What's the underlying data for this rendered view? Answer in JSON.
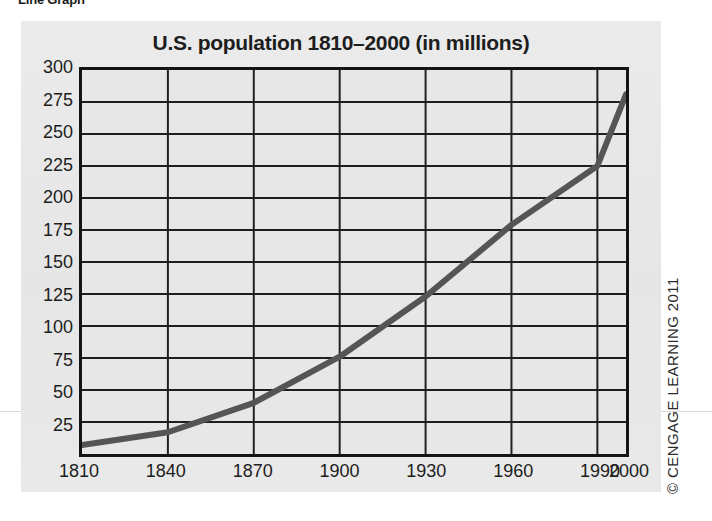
{
  "section": {
    "label": "Line Graph"
  },
  "credit": {
    "text": "© CENGAGE LEARNING 2011"
  },
  "colors": {
    "panel_background": "#e9e9e9",
    "plot_background": "#e7e7e7",
    "axis": "#141414",
    "gridline": "#1f1f1f",
    "line_series": "#555555",
    "text": "#1d1d1d"
  },
  "chart_data": {
    "type": "line",
    "title": "U.S. population 1810–2000 (in millions)",
    "xlabel": "",
    "ylabel": "",
    "xlim": [
      1810,
      2000
    ],
    "ylim": [
      0,
      300
    ],
    "grid": true,
    "legend": false,
    "x_tick_labels": [
      "1810",
      "1840",
      "1870",
      "1900",
      "1930",
      "1960",
      "1990",
      "2000"
    ],
    "x_ticks": [
      1810,
      1840,
      1870,
      1900,
      1930,
      1960,
      1990,
      2000
    ],
    "y_tick_labels": [
      "300",
      "275",
      "250",
      "225",
      "200",
      "175",
      "150",
      "125",
      "100",
      "75",
      "50",
      "25"
    ],
    "y_ticks": [
      300,
      275,
      250,
      225,
      200,
      175,
      150,
      125,
      100,
      75,
      50,
      25
    ],
    "series": [
      {
        "name": "U.S. population",
        "x": [
          1810,
          1840,
          1870,
          1900,
          1930,
          1960,
          1990,
          2000
        ],
        "values": [
          7,
          17,
          40,
          76,
          123,
          179,
          225,
          281
        ]
      }
    ]
  }
}
